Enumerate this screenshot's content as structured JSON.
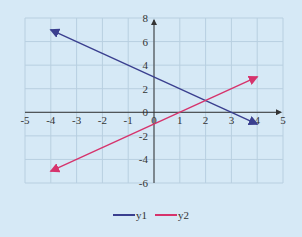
{
  "chart_data": {
    "type": "line",
    "title": "",
    "xlabel": "",
    "ylabel": "",
    "xlim": [
      -5,
      5
    ],
    "ylim": [
      -6,
      8
    ],
    "x_ticks": [
      -5,
      -4,
      -3,
      -2,
      -1,
      0,
      1,
      2,
      3,
      4,
      5
    ],
    "y_ticks": [
      -6,
      -4,
      -2,
      0,
      2,
      4,
      6,
      8
    ],
    "grid": true,
    "legend_position": "bottom",
    "series": [
      {
        "name": "y1",
        "equation": "y = -x + 3",
        "color": "#3a3f8f",
        "x": [
          -4,
          4
        ],
        "y": [
          7,
          -1
        ]
      },
      {
        "name": "y2",
        "equation": "y = x - 1",
        "color": "#d6336c",
        "x": [
          -4,
          4
        ],
        "y": [
          -5,
          3
        ]
      }
    ]
  },
  "legend": {
    "items": [
      {
        "label": "y1",
        "color": "#3a3f8f"
      },
      {
        "label": "y2",
        "color": "#d6336c"
      }
    ]
  },
  "colors": {
    "background": "#d6e9f6",
    "grid": "#b8cfe0",
    "axis": "#333333"
  }
}
